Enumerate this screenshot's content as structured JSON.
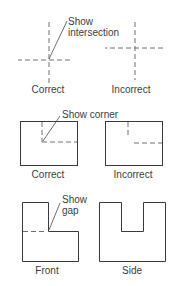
{
  "figure": {
    "row1": {
      "correct": {
        "label": "Correct",
        "callout_line1": "Show",
        "callout_line2": "intersection"
      },
      "incorrect": {
        "label": "Incorrect"
      }
    },
    "row2": {
      "correct": {
        "label": "Correct",
        "callout": "Show corner"
      },
      "incorrect": {
        "label": "Incorrect"
      }
    },
    "row3": {
      "front": {
        "label": "Front",
        "callout_line1": "Show",
        "callout_line2": "gap"
      },
      "side": {
        "label": "Side"
      }
    }
  },
  "colors": {
    "line": "#3a3a3a",
    "hidden_line": "#707070",
    "text": "#3c3c3c",
    "background": "#ffffff"
  }
}
